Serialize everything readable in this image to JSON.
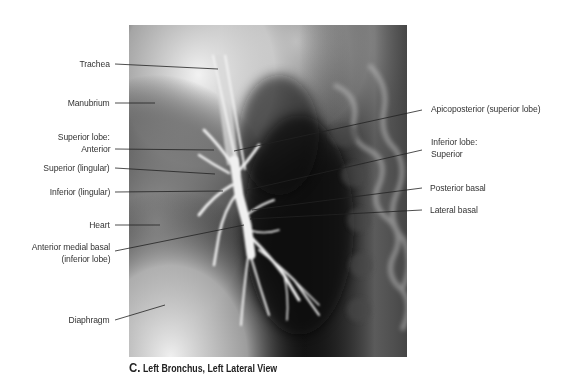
{
  "figure": {
    "caption_letter": "C.",
    "caption_text": "Left Bronchus, Left Lateral View",
    "image_type": "bronchogram-xray"
  },
  "labels_left": [
    {
      "id": "trachea",
      "text": "Trachea"
    },
    {
      "id": "manubrium",
      "text": "Manubrium"
    },
    {
      "id": "superior-lobe-anterior-1",
      "text": "Superior lobe:"
    },
    {
      "id": "superior-lobe-anterior-2",
      "text": "Anterior"
    },
    {
      "id": "superior-lingular",
      "text": "Superior (lingular)"
    },
    {
      "id": "inferior-lingular",
      "text": "Inferior (lingular)"
    },
    {
      "id": "heart",
      "text": "Heart"
    },
    {
      "id": "anterior-medial-basal-1",
      "text": "Anterior medial basal"
    },
    {
      "id": "anterior-medial-basal-2",
      "text": "(inferior lobe)"
    },
    {
      "id": "diaphragm",
      "text": "Diaphragm"
    }
  ],
  "labels_right": [
    {
      "id": "apicoposterior",
      "text": "Apicoposterior (superior lobe)"
    },
    {
      "id": "inferior-lobe-superior-1",
      "text": "Inferior lobe:"
    },
    {
      "id": "inferior-lobe-superior-2",
      "text": "Superior"
    },
    {
      "id": "posterior-basal",
      "text": "Posterior basal"
    },
    {
      "id": "lateral-basal",
      "text": "Lateral basal"
    }
  ]
}
